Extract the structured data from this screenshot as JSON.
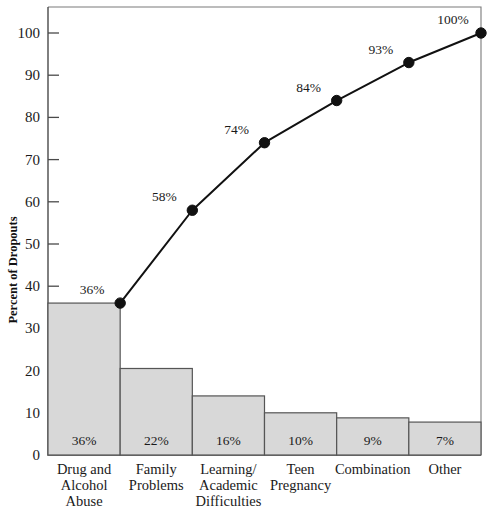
{
  "chart_data": {
    "type": "bar",
    "title": "",
    "subtitle": "",
    "xlabel": "",
    "ylabel": "Percent of Dropouts",
    "ylim": [
      0,
      100
    ],
    "yticks": [
      0,
      10,
      20,
      30,
      40,
      50,
      60,
      70,
      80,
      90,
      100
    ],
    "ytick_labels": [
      "0",
      "10",
      "20",
      "30",
      "40",
      "50",
      "60",
      "70",
      "80",
      "90",
      "100"
    ],
    "grid": false,
    "legend": null,
    "categories": [
      "Drug and Alcohol Abuse",
      "Family Problems",
      "Learning/ Academic Difficulties",
      "Teen Pregnancy",
      "Combination",
      "Other"
    ],
    "category_lines": [
      [
        "Drug and",
        "Alcohol",
        "Abuse"
      ],
      [
        "Family",
        "Problems"
      ],
      [
        "Learning/",
        "Academic",
        "Difficulties"
      ],
      [
        "Teen",
        "Pregnancy"
      ],
      [
        "Combination"
      ],
      [
        "Other"
      ]
    ],
    "series": [
      {
        "name": "Percent of Dropouts",
        "type": "bar",
        "values": [
          36,
          20.5,
          14,
          10,
          8.8,
          7.8
        ],
        "data_labels": [
          "36%",
          "22%",
          "16%",
          "10%",
          "9%",
          "7%"
        ],
        "reported_values": [
          36,
          22,
          16,
          10,
          9,
          7
        ],
        "color": "#d8d8d8",
        "edge_color": "#555555"
      },
      {
        "name": "Cumulative Percent",
        "type": "line",
        "values": [
          36,
          58,
          74,
          84,
          93,
          100
        ],
        "data_labels": [
          "36%",
          "58%",
          "74%",
          "84%",
          "93%",
          "100%"
        ],
        "color": "#111111",
        "marker": "circle"
      }
    ],
    "bar_value_labels": [
      "36%",
      "22%",
      "16%",
      "10%",
      "9%",
      "7%"
    ],
    "cumulative_labels": [
      "36%",
      "58%",
      "74%",
      "84%",
      "93%",
      "100%"
    ]
  },
  "colors": {
    "bar_fill": "#d8d8d8",
    "bar_stroke": "#555555",
    "line": "#111111",
    "axis": "#4a4a4a",
    "frame": "#7a7a7a",
    "text": "#1a1a1a",
    "background": "#ffffff"
  }
}
